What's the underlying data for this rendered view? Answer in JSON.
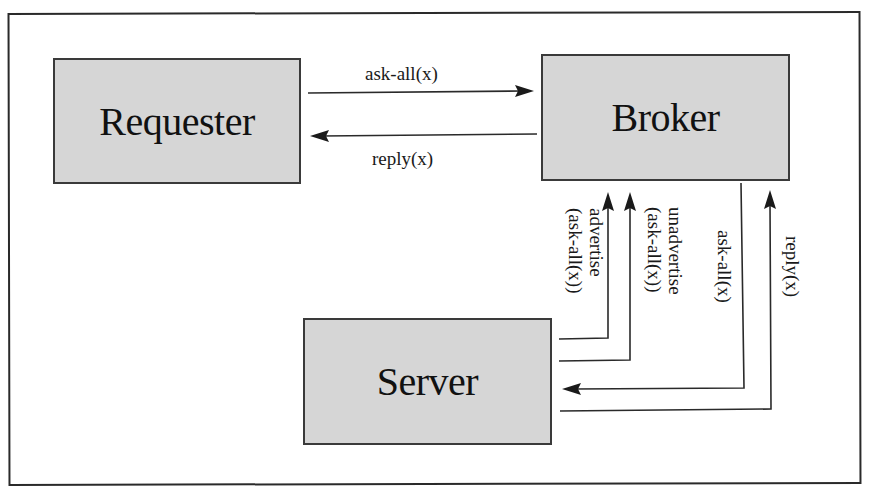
{
  "diagram": {
    "colors": {
      "node_fill": "#d6d6d6",
      "node_border": "#3a3a3a",
      "line": "#2a2a2a",
      "background": "#ffffff"
    },
    "nodes": {
      "requester": {
        "label": "Requester"
      },
      "broker": {
        "label": "Broker"
      },
      "server": {
        "label": "Server"
      }
    },
    "edges": [
      {
        "id": "req-to-broker-ask",
        "from": "Requester",
        "to": "Broker",
        "label": "ask-all(x)"
      },
      {
        "id": "broker-to-req-reply",
        "from": "Broker",
        "to": "Requester",
        "label": "reply(x)"
      },
      {
        "id": "server-to-broker-advertise",
        "from": "Server",
        "to": "Broker",
        "label_line1": "advertise",
        "label_line2": "(ask-all(x))"
      },
      {
        "id": "server-to-broker-unadvertise",
        "from": "Server",
        "to": "Broker",
        "label_line1": "unadvertise",
        "label_line2": "(ask-all(x))"
      },
      {
        "id": "broker-to-server-ask",
        "from": "Broker",
        "to": "Server",
        "label": "ask-all(x)"
      },
      {
        "id": "server-to-broker-reply",
        "from": "Server",
        "to": "Broker",
        "label": "reply(x)"
      }
    ]
  }
}
